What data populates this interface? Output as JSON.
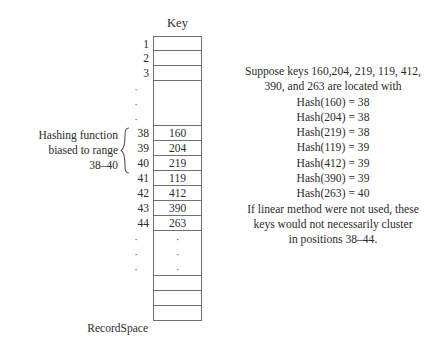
{
  "figure": {
    "key_header": "Key",
    "recordspace_label": "RecordSpace"
  },
  "left_annotation": {
    "line1": "Hashing function",
    "line2": "biased to range",
    "line3": "38–40",
    "brace_glyph": "{"
  },
  "table": {
    "dot_glyph": "·",
    "rows": [
      {
        "index": "1",
        "value": ""
      },
      {
        "index": "2",
        "value": ""
      },
      {
        "index": "3",
        "value": ""
      },
      {
        "index": "dots-top",
        "value": ""
      },
      {
        "index": "38",
        "value": "160"
      },
      {
        "index": "39",
        "value": "204"
      },
      {
        "index": "40",
        "value": "219"
      },
      {
        "index": "41",
        "value": "119"
      },
      {
        "index": "42",
        "value": "412"
      },
      {
        "index": "43",
        "value": "390"
      },
      {
        "index": "44",
        "value": "263"
      },
      {
        "index": "dots-bottom",
        "value": "dots"
      },
      {
        "index": "",
        "value": ""
      },
      {
        "index": "",
        "value": ""
      },
      {
        "index": "",
        "value": ""
      }
    ]
  },
  "explanation": {
    "lines": [
      "Suppose keys 160,204, 219, 119, 412,",
      "390, and 263 are located with",
      "Hash(160) = 38",
      "Hash(204) = 38",
      "Hash(219) = 38",
      "Hash(119) = 39",
      "Hash(412) = 39",
      "Hash(390) = 39",
      "Hash(263) = 40",
      "If linear method were not used, these",
      "keys would not necessarily cluster",
      "in positions 38–44."
    ]
  },
  "colors": {
    "background": "#ffffff",
    "text": "#2b2b2b",
    "rule": "#6f6f6f"
  }
}
